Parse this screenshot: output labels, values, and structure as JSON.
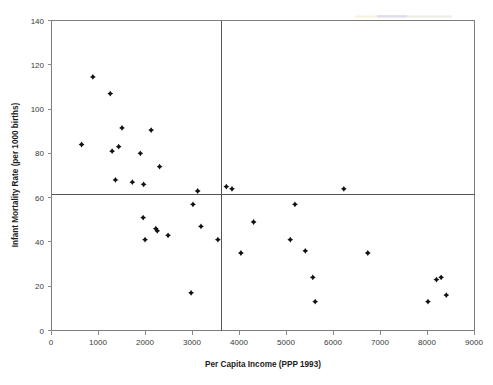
{
  "chart_data": {
    "type": "scatter",
    "title": "",
    "xlabel": "Per Capita Income (PPP 1993)",
    "ylabel": "Infant Mortality Rate (per 1000 births)",
    "xlim": [
      0,
      9000
    ],
    "ylim": [
      0,
      140
    ],
    "xticks": [
      0,
      1000,
      2000,
      3000,
      4000,
      5000,
      6000,
      7000,
      8000,
      9000
    ],
    "xtick_labels": [
      "0",
      "1000",
      "2000",
      "3000",
      "4000",
      "5000",
      "6000",
      "7000",
      "8000",
      "9000"
    ],
    "yticks": [
      0,
      20,
      40,
      60,
      80,
      100,
      120,
      140
    ],
    "ytick_labels": [
      "0",
      "20",
      "40",
      "60",
      "80",
      "100",
      "120",
      "140"
    ],
    "grid": false,
    "legend": "none",
    "marker_style": "filled-diamond",
    "marker_color": "#111111",
    "reference_lines": [
      {
        "orientation": "horizontal",
        "value": 63,
        "label": "median infant mortality rate"
      },
      {
        "orientation": "vertical",
        "value": 3620,
        "label": "median per capita income"
      }
    ],
    "series": [
      {
        "name": "Countries",
        "points": [
          {
            "x": 640,
            "y": 84
          },
          {
            "x": 880,
            "y": 114.5
          },
          {
            "x": 1250,
            "y": 107
          },
          {
            "x": 1290,
            "y": 81
          },
          {
            "x": 1360,
            "y": 68
          },
          {
            "x": 1430,
            "y": 83
          },
          {
            "x": 1500,
            "y": 91.5
          },
          {
            "x": 1720,
            "y": 67
          },
          {
            "x": 1890,
            "y": 80
          },
          {
            "x": 1950,
            "y": 51
          },
          {
            "x": 1960,
            "y": 66
          },
          {
            "x": 1990,
            "y": 41
          },
          {
            "x": 2120,
            "y": 90.5
          },
          {
            "x": 2220,
            "y": 46
          },
          {
            "x": 2250,
            "y": 45
          },
          {
            "x": 2300,
            "y": 74
          },
          {
            "x": 2480,
            "y": 43
          },
          {
            "x": 2970,
            "y": 17
          },
          {
            "x": 3010,
            "y": 57
          },
          {
            "x": 3110,
            "y": 63
          },
          {
            "x": 3180,
            "y": 47
          },
          {
            "x": 3540,
            "y": 41
          },
          {
            "x": 3720,
            "y": 65
          },
          {
            "x": 3840,
            "y": 64
          },
          {
            "x": 4030,
            "y": 35
          },
          {
            "x": 4300,
            "y": 49
          },
          {
            "x": 5080,
            "y": 41
          },
          {
            "x": 5180,
            "y": 57
          },
          {
            "x": 5400,
            "y": 36
          },
          {
            "x": 5560,
            "y": 24
          },
          {
            "x": 5610,
            "y": 13
          },
          {
            "x": 6220,
            "y": 64
          },
          {
            "x": 6730,
            "y": 35
          },
          {
            "x": 8010,
            "y": 13
          },
          {
            "x": 8190,
            "y": 23
          },
          {
            "x": 8290,
            "y": 24
          },
          {
            "x": 8400,
            "y": 16
          }
        ]
      }
    ]
  },
  "figure": {
    "background_color": "#ffffff",
    "frame_color": "#7d7d7d",
    "reference_line_color": "#555555",
    "axis_label_color": "#1c1c1c",
    "tick_label_color": "#3a3a3a"
  }
}
